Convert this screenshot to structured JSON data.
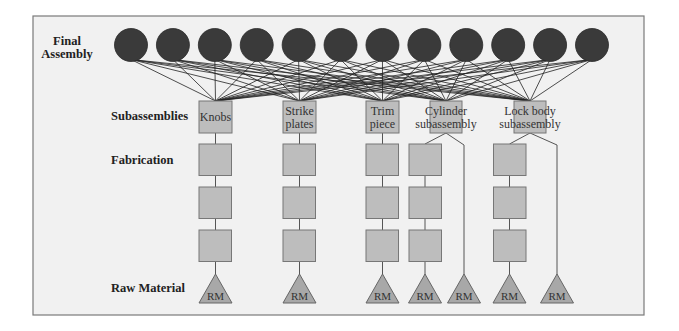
{
  "colors": {
    "frame_fill": "#f1f1f1",
    "frame_stroke": "#7a7a7a",
    "final_assembly_circle": "#3a3a3a",
    "subassembly_box": "#bdbdbd",
    "fabrication_box": "#bdbdbd",
    "raw_material_triangle": "#a8a8a8"
  },
  "row_labels": {
    "final_assembly_line1": "Final",
    "final_assembly_line2": "Assembly",
    "subassemblies": "Subassemblies",
    "fabrication": "Fabrication",
    "raw_material": "Raw Material"
  },
  "final_assembly": {
    "count": 12,
    "description": "Each final assembly node connects to every subassembly"
  },
  "subassemblies": [
    {
      "id": "knobs",
      "line1": "Knobs",
      "line2": "",
      "fabrication_steps": 3,
      "raw_materials": 1
    },
    {
      "id": "strike-plates",
      "line1": "Strike",
      "line2": "plates",
      "fabrication_steps": 3,
      "raw_materials": 1
    },
    {
      "id": "trim-piece",
      "line1": "Trim",
      "line2": "piece",
      "fabrication_steps": 3,
      "raw_materials": 1
    },
    {
      "id": "cylinder-subassembly",
      "line1": "Cylinder",
      "line2": "subassembly",
      "fabrication_steps": 3,
      "raw_materials": 2
    },
    {
      "id": "lock-body-subassembly",
      "line1": "Lock body",
      "line2": "subassembly",
      "fabrication_steps": 3,
      "raw_materials": 2
    }
  ],
  "raw_material_label": "RM"
}
